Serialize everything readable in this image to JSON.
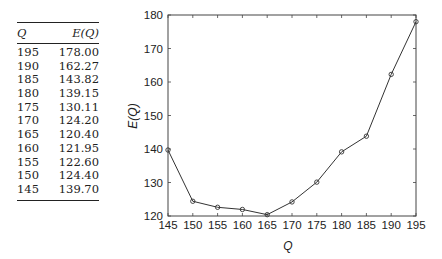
{
  "table": {
    "headers": [
      "Q",
      "E(Q)"
    ],
    "rows": [
      [
        "195",
        "178.00"
      ],
      [
        "190",
        "162.27"
      ],
      [
        "185",
        "143.82"
      ],
      [
        "180",
        "139.15"
      ],
      [
        "175",
        "130.11"
      ],
      [
        "170",
        "124.20"
      ],
      [
        "165",
        "120.40"
      ],
      [
        "160",
        "121.95"
      ],
      [
        "155",
        "122.60"
      ],
      [
        "150",
        "124.40"
      ],
      [
        "145",
        "139.70"
      ]
    ]
  },
  "chart_data": {
    "type": "line",
    "title": "",
    "xlabel": "Q",
    "ylabel": "E(Q)",
    "x": [
      145,
      150,
      155,
      160,
      165,
      170,
      175,
      180,
      185,
      190,
      195
    ],
    "series": [
      {
        "name": "E(Q)",
        "values": [
          139.7,
          124.4,
          122.6,
          121.95,
          120.4,
          124.2,
          130.11,
          139.15,
          143.82,
          162.27,
          178.0
        ],
        "marker": "circle",
        "color": "#333333"
      }
    ],
    "xlim": [
      145,
      195
    ],
    "ylim": [
      120,
      180
    ],
    "xticks": [
      145,
      150,
      155,
      160,
      165,
      170,
      175,
      180,
      185,
      190,
      195
    ],
    "yticks": [
      120,
      130,
      140,
      150,
      160,
      170,
      180
    ],
    "grid": false,
    "legend": null
  }
}
